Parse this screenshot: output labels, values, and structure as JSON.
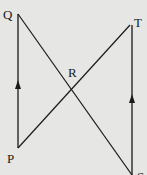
{
  "diagram": {
    "type": "geometry",
    "colors": {
      "background": "#e6e6e4",
      "stroke": "#1a1a1a"
    },
    "points": {
      "Q": {
        "label": "Q",
        "x": 18,
        "y": 14
      },
      "T": {
        "label": "T",
        "x": 130,
        "y": 25
      },
      "R": {
        "label": "R",
        "x": 73,
        "y": 89
      },
      "P": {
        "label": "P",
        "x": 18,
        "y": 148
      },
      "S": {
        "label": "S",
        "x": 132,
        "y": 175
      }
    },
    "segments": [
      {
        "from": "P",
        "to": "Q",
        "arrow": "up",
        "marker": "parallel"
      },
      {
        "from": "S",
        "to": "T",
        "arrow": "up",
        "marker": "parallel"
      },
      {
        "from": "Q",
        "to": "S"
      },
      {
        "from": "P",
        "to": "T"
      }
    ]
  }
}
